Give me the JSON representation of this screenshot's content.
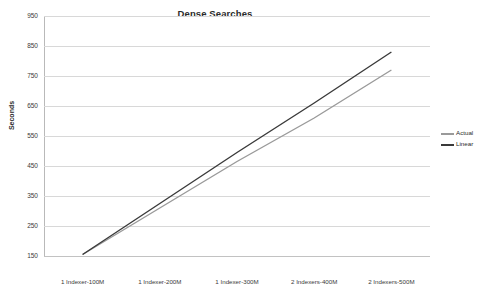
{
  "chart_data": {
    "type": "line",
    "title": "Dense Searches",
    "xlabel": "",
    "ylabel": "Seconds",
    "categories": [
      "1 Indexer-100M",
      "1 Indexer-200M",
      "1 Indexer-300M",
      "2 Indexers-400M",
      "2 Indexers-500M"
    ],
    "series": [
      {
        "name": "Actual",
        "values": [
          155,
          310,
          465,
          610,
          770
        ],
        "color": "#9a9a9a"
      },
      {
        "name": "Linear",
        "values": [
          155,
          325,
          495,
          660,
          830
        ],
        "color": "#3a3a3a"
      }
    ],
    "ylim": [
      150,
      950
    ],
    "yticks": [
      950,
      850,
      750,
      650,
      550,
      450,
      350,
      250,
      150
    ],
    "grid": true,
    "legend_position": "right"
  },
  "legend": {
    "items": [
      {
        "label": "Actual"
      },
      {
        "label": "Linear"
      }
    ]
  }
}
